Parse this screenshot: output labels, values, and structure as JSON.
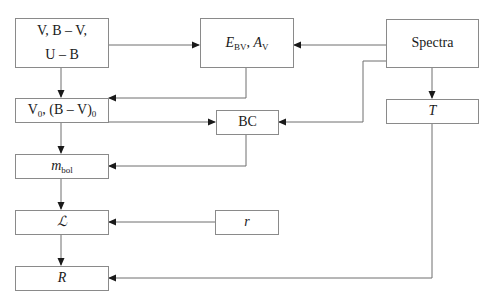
{
  "diagram": {
    "nodes": {
      "photometry": {
        "line1": "V, B – V,",
        "line2": "U – B"
      },
      "extinction": {
        "e_main": "E",
        "e_sub": "BV",
        "sep": ", ",
        "a_main": "A",
        "a_sub": "V"
      },
      "spectra": {
        "label": "Spectra"
      },
      "dereddened": {
        "v_main": "V",
        "v_sub": "0",
        "mid": ", (B – V)",
        "bv_sub": "0"
      },
      "bolometric_correction": {
        "label": "BC"
      },
      "temperature": {
        "label": "T"
      },
      "bolometric_magnitude": {
        "main": "m",
        "sub": "bol"
      },
      "luminosity": {
        "label": "ℒ"
      },
      "distance": {
        "label": "r"
      },
      "radius": {
        "label": "R"
      }
    },
    "edges": [
      {
        "from": "photometry",
        "to": "extinction"
      },
      {
        "from": "spectra",
        "to": "extinction"
      },
      {
        "from": "spectra",
        "to": "bolometric_correction"
      },
      {
        "from": "spectra",
        "to": "temperature"
      },
      {
        "from": "photometry",
        "to": "dereddened"
      },
      {
        "from": "extinction",
        "to": "dereddened"
      },
      {
        "from": "dereddened",
        "to": "bolometric_correction"
      },
      {
        "from": "dereddened",
        "to": "bolometric_magnitude"
      },
      {
        "from": "bolometric_correction",
        "to": "bolometric_magnitude"
      },
      {
        "from": "bolometric_magnitude",
        "to": "luminosity"
      },
      {
        "from": "distance",
        "to": "luminosity"
      },
      {
        "from": "luminosity",
        "to": "radius"
      },
      {
        "from": "temperature",
        "to": "radius"
      }
    ],
    "colors": {
      "line": "#6e6e6e",
      "border": "#8a8a8a",
      "text": "#1a1a1a"
    }
  }
}
